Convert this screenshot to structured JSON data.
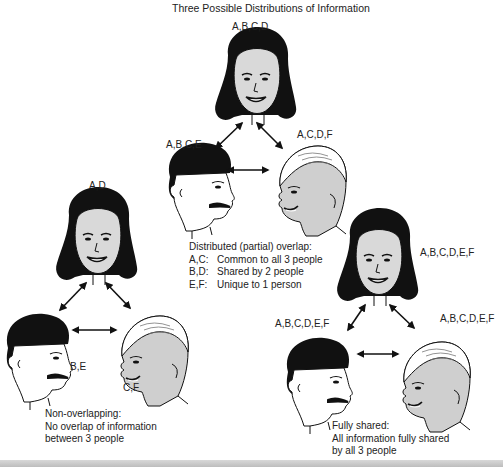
{
  "title": "Three Possible Distributions of Information",
  "diagrams": {
    "partial": {
      "top_person": {
        "info": "A,B,C,D",
        "type": "woman"
      },
      "left_person": {
        "info": "A,B,C,E",
        "type": "dark-haired man"
      },
      "right_person": {
        "info": "A,C,D,F",
        "type": "light-haired man"
      },
      "caption_title": "Distributed (partial) overlap:",
      "legend": [
        {
          "keys": "A,C:",
          "text": "Common to all 3 people"
        },
        {
          "keys": "B,D:",
          "text": "Shared by 2 people"
        },
        {
          "keys": "E,F:",
          "text": "Unique to 1 person"
        }
      ]
    },
    "non_overlapping": {
      "top_person": {
        "info": "A,D",
        "type": "woman"
      },
      "left_person": {
        "info": "B,E",
        "type": "dark-haired man"
      },
      "right_person": {
        "info": "C,F",
        "type": "light-haired man"
      },
      "caption_lines": [
        "Non-overlapping:",
        "No overlap of information",
        "between 3 people"
      ]
    },
    "fully_shared": {
      "top_person": {
        "info": "A,B,C,D,E,F",
        "type": "woman"
      },
      "left_person": {
        "info": "A,B,C,D,E,F",
        "type": "dark-haired man"
      },
      "right_person": {
        "info": "A,B,C,D,E,F",
        "type": "light-haired man"
      },
      "caption_lines": [
        "Fully shared:",
        "All information fully shared",
        "by all 3 people"
      ]
    }
  },
  "colors": {
    "hair_dark": "#111111",
    "skin_woman": "#d9d9d9",
    "skin_man_dark": "#ffffff",
    "skin_man_light": "#cfcfcf",
    "arrow": "#111111",
    "bottom_bar": "#c4c4c4"
  }
}
